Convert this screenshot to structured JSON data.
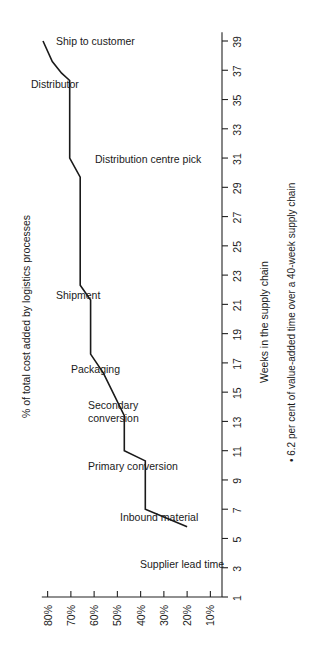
{
  "chart_data": {
    "type": "line",
    "title": "",
    "subtitle": "",
    "orientation": "rotated-90",
    "xlabel": "% of total cost added by logistics processes",
    "ylabel": "Weeks in the supply chain",
    "xlim": [
      85,
      5
    ],
    "ylim": [
      1,
      39
    ],
    "grid": false,
    "legend": null,
    "x_tick_labels": [
      "80%",
      "70%",
      "60%",
      "50%",
      "40%",
      "30%",
      "20%",
      "10%"
    ],
    "x_tick_values": [
      80,
      70,
      60,
      50,
      40,
      30,
      20,
      10
    ],
    "y_tick_labels": [
      "1",
      "3",
      "5",
      "7",
      "9",
      "11",
      "13",
      "15",
      "17",
      "19",
      "21",
      "23",
      "25",
      "27",
      "29",
      "31",
      "33",
      "35",
      "37",
      "39"
    ],
    "y_tick_values": [
      1,
      3,
      5,
      7,
      9,
      11,
      13,
      15,
      17,
      19,
      21,
      23,
      25,
      27,
      29,
      31,
      33,
      35,
      37,
      39
    ],
    "series": [
      {
        "name": "Cumulative cost added vs. weeks in supply chain",
        "points": [
          {
            "cost_pct": 82.0,
            "week": 39.0
          },
          {
            "cost_pct": 78.0,
            "week": 37.6
          },
          {
            "cost_pct": 74.0,
            "week": 36.8
          },
          {
            "cost_pct": 70.5,
            "week": 36.3
          },
          {
            "cost_pct": 70.5,
            "week": 31.0
          },
          {
            "cost_pct": 66.0,
            "week": 29.7
          },
          {
            "cost_pct": 66.0,
            "week": 22.3
          },
          {
            "cost_pct": 61.5,
            "week": 21.3
          },
          {
            "cost_pct": 61.5,
            "week": 17.6
          },
          {
            "cost_pct": 56.0,
            "week": 16.3
          },
          {
            "cost_pct": 47.0,
            "week": 13.4
          },
          {
            "cost_pct": 47.0,
            "week": 11.0
          },
          {
            "cost_pct": 38.0,
            "week": 10.3
          },
          {
            "cost_pct": 38.0,
            "week": 7.0
          },
          {
            "cost_pct": 20.0,
            "week": 5.8
          }
        ]
      }
    ],
    "annotations": [
      {
        "label": "Ship to customer",
        "px": 56,
        "py": 45,
        "anchor": "start"
      },
      {
        "label": "Distributor",
        "px": 31,
        "py": 88,
        "anchor": "start"
      },
      {
        "label": "Distribution centre pick",
        "px": 95,
        "py": 163,
        "anchor": "start"
      },
      {
        "label": "Shipment",
        "px": 56,
        "py": 299,
        "anchor": "start"
      },
      {
        "label": "Packaging",
        "px": 71,
        "py": 373,
        "anchor": "start"
      },
      {
        "label": "Secondary conversion",
        "line1": "Secondary",
        "line2": "conversion",
        "px": 88,
        "py": 409,
        "anchor": "start"
      },
      {
        "label": "Primary conversion",
        "px": 88,
        "py": 470,
        "anchor": "start"
      },
      {
        "label": "Inbound material",
        "px": 120,
        "py": 521,
        "anchor": "start"
      },
      {
        "label": "Supplier lead time",
        "px": 140,
        "py": 568,
        "anchor": "start"
      }
    ],
    "footnote": "6.2 per cent of value-added time over a 40-week supply chain",
    "footnote_bullet": "•"
  },
  "axis": {
    "x_title": "% of total cost added by logistics processes",
    "y_title": "Weeks in the supply chain"
  },
  "colors": {
    "line": "#1a1a1a",
    "axis": "#222222",
    "background": "#ffffff"
  }
}
